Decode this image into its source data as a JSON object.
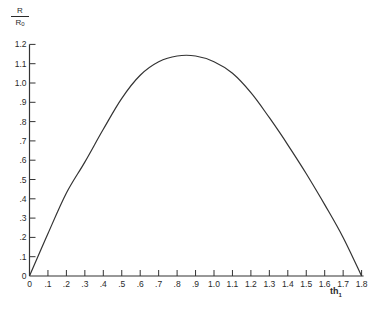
{
  "chart_data": {
    "type": "line",
    "title": "",
    "xlabel": "th1",
    "xlabel_main": "th",
    "xlabel_sub": "1",
    "ylabel": "R/R0",
    "ylabel_num": "R",
    "ylabel_den_main": "R",
    "ylabel_den_sub": "0",
    "xlim": [
      0,
      1.8
    ],
    "ylim": [
      0,
      1.2
    ],
    "grid": false,
    "legend": null,
    "x_ticks": [
      0,
      0.1,
      0.2,
      0.3,
      0.4,
      0.5,
      0.6,
      0.7,
      0.8,
      0.9,
      1.0,
      1.1,
      1.2,
      1.3,
      1.4,
      1.5,
      1.6,
      1.7,
      1.8
    ],
    "x_tick_labels": [
      "0",
      ".1",
      ".2",
      ".3",
      ".4",
      ".5",
      ".6",
      ".7",
      ".8",
      ".9",
      "1.0",
      "1.1",
      "1.2",
      "1.3",
      "1.4",
      "1.5",
      "1.6",
      "1.7",
      "1.8"
    ],
    "y_ticks": [
      0,
      0.1,
      0.2,
      0.3,
      0.4,
      0.5,
      0.6,
      0.7,
      0.8,
      0.9,
      1.0,
      1.1,
      1.2
    ],
    "y_tick_labels": [
      "0",
      ".1",
      ".2",
      ".3",
      ".4",
      ".5",
      ".6",
      ".7",
      ".8",
      ".9",
      "1.0",
      "1.1",
      "1.2"
    ],
    "series": [
      {
        "name": "R/R0",
        "x": [
          0,
          0.1,
          0.2,
          0.3,
          0.4,
          0.5,
          0.6,
          0.7,
          0.8,
          0.9,
          1.0,
          1.1,
          1.2,
          1.3,
          1.4,
          1.5,
          1.6,
          1.7,
          1.8
        ],
        "values": [
          0,
          0.22,
          0.43,
          0.59,
          0.76,
          0.92,
          1.04,
          1.11,
          1.14,
          1.14,
          1.11,
          1.05,
          0.95,
          0.82,
          0.68,
          0.53,
          0.37,
          0.2,
          0.0
        ]
      }
    ]
  }
}
